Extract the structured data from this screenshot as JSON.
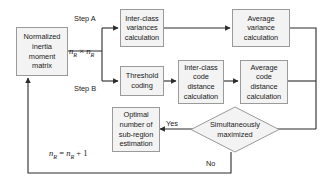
{
  "diagram": {
    "colors": {
      "node_fill": "#f3f3f3",
      "node_border": "#9a9a9a",
      "line": "#2b2b2b",
      "text": "#1b1b1b",
      "background": "#ffffff"
    },
    "nodes": [
      {
        "id": "normalized-inertia-moment-matrix",
        "label": "Normalized\ninertia\nmoment\nmatrix",
        "shape": "rect"
      },
      {
        "id": "inter-class-variances-calculation",
        "label": "Inter-class\nvariances\ncalculation",
        "shape": "rect"
      },
      {
        "id": "average-variance-calculation",
        "label": "Average\nvariance\ncalculation",
        "shape": "rect"
      },
      {
        "id": "threshold-coding",
        "label": "Threshold\ncoding",
        "shape": "rect"
      },
      {
        "id": "inter-class-code-distance-calculation",
        "label": "Inter-class\ncode\ndistance\ncalculation",
        "shape": "rect"
      },
      {
        "id": "average-code-distance-calculation",
        "label": "Average\ncode\ndistance\ncalculation",
        "shape": "rect"
      },
      {
        "id": "optimal-number-of-sub-region-estimation",
        "label": "Optimal\nnumber of\nsub-region\nestimation",
        "shape": "rect"
      },
      {
        "id": "simultaneously-maximized",
        "label": "Simultaneously\nmaximized",
        "shape": "diamond"
      }
    ],
    "edge_labels": {
      "step_a": "Step A",
      "step_b": "Step B",
      "yes": "Yes",
      "no": "No"
    },
    "formulas": {
      "matrix_size": {
        "var": "n",
        "sub": "R",
        "operator": "×",
        "text": "nR × nR"
      },
      "increment": {
        "text": "nR = nR + 1",
        "lhs_var": "n",
        "lhs_sub": "R",
        "equals": "=",
        "rhs_var": "n",
        "rhs_sub": "R",
        "plus": "+",
        "one": "1"
      }
    }
  }
}
